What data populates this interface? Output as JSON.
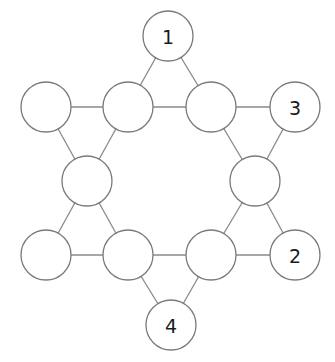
{
  "diagram": {
    "type": "hexagram-graph",
    "node_radius": 25,
    "colors": {
      "stroke": "#7a7a7a",
      "edge": "#8a8a8a",
      "label": "#1a1a1a",
      "fill": "#ffffff"
    },
    "nodes": [
      {
        "id": "top",
        "x": 168,
        "y": 36,
        "label": "1"
      },
      {
        "id": "upper-left-outer",
        "x": 46,
        "y": 107,
        "label": ""
      },
      {
        "id": "upper-left-inner",
        "x": 128,
        "y": 107,
        "label": ""
      },
      {
        "id": "upper-right-inner",
        "x": 211,
        "y": 107,
        "label": ""
      },
      {
        "id": "upper-right-outer",
        "x": 295,
        "y": 107,
        "label": "3"
      },
      {
        "id": "middle-left",
        "x": 87,
        "y": 181,
        "label": ""
      },
      {
        "id": "middle-right",
        "x": 255,
        "y": 181,
        "label": ""
      },
      {
        "id": "lower-left-outer",
        "x": 46,
        "y": 255,
        "label": ""
      },
      {
        "id": "lower-left-inner",
        "x": 128,
        "y": 255,
        "label": ""
      },
      {
        "id": "lower-right-inner",
        "x": 211,
        "y": 255,
        "label": ""
      },
      {
        "id": "lower-right-outer",
        "x": 295,
        "y": 255,
        "label": "2"
      },
      {
        "id": "bottom",
        "x": 171,
        "y": 325,
        "label": "4"
      }
    ],
    "edges": [
      [
        "top",
        "upper-left-inner"
      ],
      [
        "top",
        "upper-right-inner"
      ],
      [
        "upper-left-outer",
        "upper-left-inner"
      ],
      [
        "upper-left-inner",
        "upper-right-inner"
      ],
      [
        "upper-right-inner",
        "upper-right-outer"
      ],
      [
        "upper-left-outer",
        "middle-left"
      ],
      [
        "upper-left-inner",
        "middle-left"
      ],
      [
        "upper-right-inner",
        "middle-right"
      ],
      [
        "upper-right-outer",
        "middle-right"
      ],
      [
        "middle-left",
        "lower-left-outer"
      ],
      [
        "middle-left",
        "lower-left-inner"
      ],
      [
        "middle-right",
        "lower-right-inner"
      ],
      [
        "middle-right",
        "lower-right-outer"
      ],
      [
        "lower-left-outer",
        "lower-left-inner"
      ],
      [
        "lower-left-inner",
        "lower-right-inner"
      ],
      [
        "lower-right-inner",
        "lower-right-outer"
      ],
      [
        "lower-left-inner",
        "bottom"
      ],
      [
        "lower-right-inner",
        "bottom"
      ]
    ]
  }
}
